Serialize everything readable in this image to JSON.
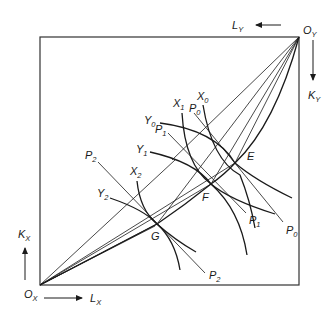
{
  "diagram": {
    "type": "edgeworth-box",
    "origins": {
      "x": {
        "label": "O",
        "sub": "X"
      },
      "y": {
        "label": "O",
        "sub": "Y"
      }
    },
    "axes": {
      "lx": {
        "label": "L",
        "sub": "X"
      },
      "kx": {
        "label": "K",
        "sub": "X"
      },
      "ly": {
        "label": "L",
        "sub": "Y"
      },
      "ky": {
        "label": "K",
        "sub": "Y"
      }
    },
    "points": {
      "e": "E",
      "f": "F",
      "g": "G"
    },
    "isoquants_x": [
      {
        "label": "X",
        "sub": "0"
      },
      {
        "label": "X",
        "sub": "1"
      },
      {
        "label": "X",
        "sub": "2"
      }
    ],
    "isoquants_y": [
      {
        "label": "Y",
        "sub": "0"
      },
      {
        "label": "Y",
        "sub": "1"
      },
      {
        "label": "Y",
        "sub": "2"
      }
    ],
    "price_lines": [
      {
        "label": "P",
        "sub": "0"
      },
      {
        "label": "P",
        "sub": "1"
      },
      {
        "label": "P",
        "sub": "2"
      }
    ],
    "colors": {
      "ink": "#1a1a1a",
      "frame": "#333333",
      "background": "#ffffff"
    }
  }
}
